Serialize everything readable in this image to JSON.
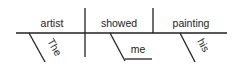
{
  "diagram": {
    "type": "sentence-diagram",
    "sentence": "The artist showed me his painting",
    "line_color": "#222222",
    "main_line": {
      "subject": "artist",
      "verb": "showed",
      "direct_object": "painting"
    },
    "modifiers": [
      {
        "word": "The",
        "modifies": "artist"
      },
      {
        "word": "his",
        "modifies": "painting"
      }
    ],
    "indirect_object": {
      "word": "me",
      "attached_to": "showed"
    }
  }
}
